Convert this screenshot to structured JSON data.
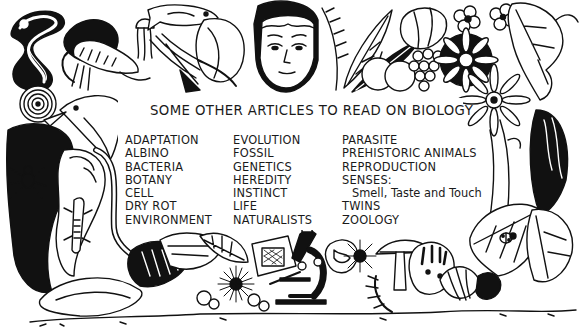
{
  "document": {
    "heading": "SOME OTHER ARTICLES TO READ ON BIOLOGY",
    "columns": [
      {
        "items": [
          "ADAPTATION",
          "ALBINO",
          "BACTERIA",
          "BOTANY",
          "CELL",
          "DRY ROT",
          "ENVIRONMENT"
        ]
      },
      {
        "items": [
          "EVOLUTION",
          "FOSSIL",
          "GENETICS",
          "HEREDITY",
          "INSTINCT",
          "LIFE",
          "NATURALISTS"
        ]
      },
      {
        "items": [
          "PARASITE",
          "PREHISTORIC ANIMALS",
          "REPRODUCTION",
          "SENSES:",
          "Smell, Taste and Touch",
          "TWINS",
          "ZOOLOGY"
        ]
      }
    ]
  },
  "illustration": {
    "style": "black-and-white pen and ink border",
    "colors": {
      "ink": "#111111",
      "paper": "#ffffff"
    },
    "motifs": [
      "snake-icon",
      "shrimp-icon",
      "jellyfish-icon",
      "fish-icon",
      "seaweed-icon",
      "human-face-icon",
      "wheat-leaves-icon",
      "fruit-icon",
      "grapes-icon",
      "daisy-flower-icon",
      "vine-leaf-icon",
      "bird-icon",
      "spider-icon",
      "lizard-icon",
      "snail-shell-icon",
      "microscope-icon",
      "slide-specimen-icon",
      "sea-urchin-icon",
      "cells-icon",
      "mushroom-icon",
      "fern-icon",
      "ladybird-icon",
      "leaf-icon",
      "seed-pod-icon"
    ]
  }
}
